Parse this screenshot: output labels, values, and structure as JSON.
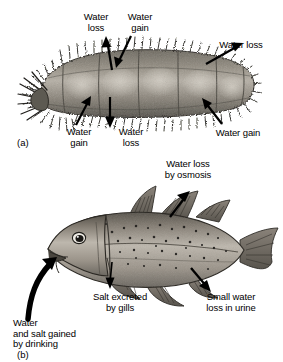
{
  "figure": {
    "background_color": "#ffffff",
    "text_color": "#000000",
    "width": 283,
    "height": 362
  },
  "panel_a": {
    "tag": "(a)",
    "organism": "marine-bristle-worm",
    "organism_colors": {
      "body_light": "#b9b3a9",
      "body_mid": "#8a8378",
      "body_dark": "#4a4740",
      "bristle": "#2c2a26"
    },
    "labels": [
      {
        "id": "a-top-left",
        "text": "Water\nloss",
        "align": "center"
      },
      {
        "id": "a-top-mid",
        "text": "Water\ngain",
        "align": "center"
      },
      {
        "id": "a-top-right",
        "text": "Water loss",
        "align": "center"
      },
      {
        "id": "a-bottom-left",
        "text": "Water\ngain",
        "align": "center"
      },
      {
        "id": "a-bottom-mid",
        "text": "Water\nloss",
        "align": "center"
      },
      {
        "id": "a-bottom-right",
        "text": "Water gain",
        "align": "center"
      }
    ]
  },
  "panel_b": {
    "tag": "(b)",
    "organism": "marine-bony-fish",
    "organism_colors": {
      "body_light": "#c3bdb3",
      "body_mid": "#918a7f",
      "body_dark": "#3d3a34",
      "fin": "#6d675d"
    },
    "labels": [
      {
        "id": "b-top",
        "text": "Water loss\nby osmosis",
        "align": "center"
      },
      {
        "id": "b-gills",
        "text": "Salt excreted\nby gills",
        "align": "center"
      },
      {
        "id": "b-urine",
        "text": "Small water\nloss in urine",
        "align": "center"
      },
      {
        "id": "b-drinking",
        "text": "Water\nand salt gained\nby drinking",
        "align": "left"
      }
    ]
  }
}
